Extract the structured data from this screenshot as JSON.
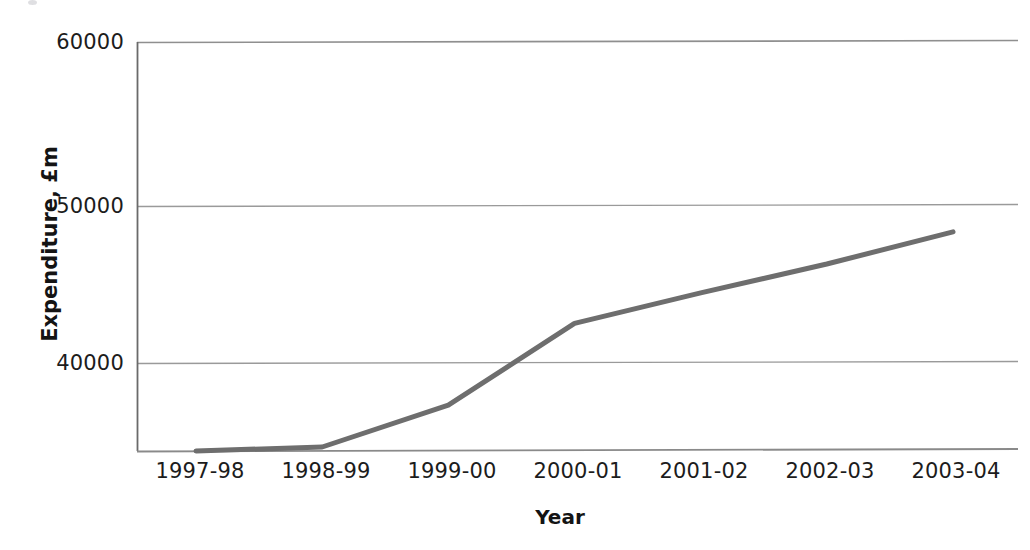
{
  "chart_data": {
    "type": "line",
    "title": "",
    "subtitle": "",
    "xlabel": "Year",
    "ylabel": "Expenditure, £m",
    "categories": [
      "1997-98",
      "1998-99",
      "1999-00",
      "2000-01",
      "2001-02",
      "2002-03",
      "2003-04"
    ],
    "series": [
      {
        "name": "Expenditure",
        "values": [
          33900,
          34800,
          37400,
          42500,
          44400,
          46200,
          48200
        ],
        "color": "#6e6e6e"
      }
    ],
    "yticks": [
      40000,
      50000,
      60000
    ],
    "ytick_labels": [
      "40000",
      "50000",
      "60000"
    ],
    "ylim": [
      33900,
      60000
    ],
    "xlim": [
      0,
      6
    ],
    "grid": "horizontal",
    "legend": "none"
  },
  "axes": {
    "y_title": "Expenditure, £m",
    "x_title": "Year",
    "y_labels": [
      {
        "text": "60000",
        "value": 60000
      },
      {
        "text": "50000",
        "value": 50000
      },
      {
        "text": "40000",
        "value": 40000
      }
    ],
    "x_labels": [
      {
        "text": "1997-98"
      },
      {
        "text": "1998-99"
      },
      {
        "text": "1999-00"
      },
      {
        "text": "2000-01"
      },
      {
        "text": "2001-02"
      },
      {
        "text": "2002-03"
      },
      {
        "text": "2003-04"
      }
    ]
  },
  "style": {
    "line_color": "#6e6e6e",
    "grid_color": "#8c8c8c",
    "axis_color": "#5a5a5a",
    "text_color": "#1c1c1c",
    "background": "#ffffff"
  }
}
